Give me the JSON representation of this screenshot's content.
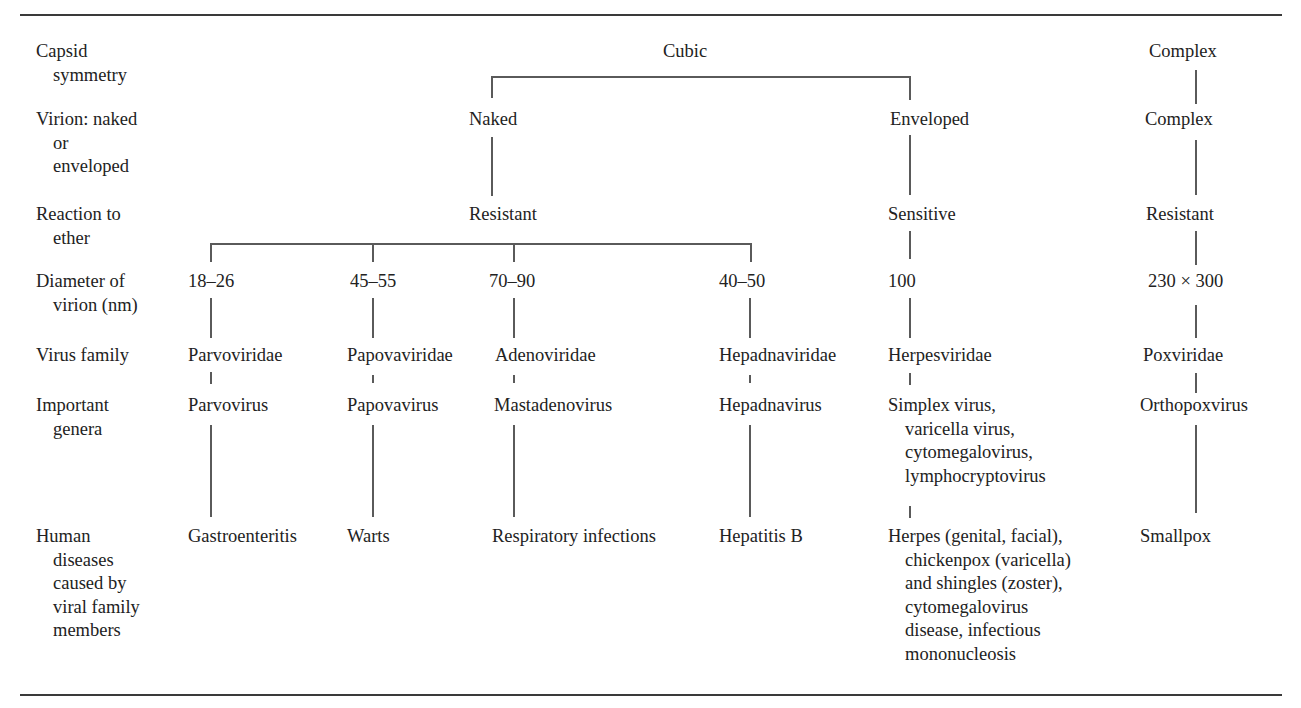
{
  "row_labels": [
    {
      "id": "capsid",
      "lines": [
        "Capsid",
        "symmetry"
      ]
    },
    {
      "id": "virion",
      "lines": [
        "Virion: naked",
        "or",
        "enveloped"
      ]
    },
    {
      "id": "ether",
      "lines": [
        "Reaction to",
        "ether"
      ]
    },
    {
      "id": "diameter",
      "lines": [
        "Diameter of",
        "virion (nm)"
      ]
    },
    {
      "id": "family",
      "lines": [
        "Virus family"
      ]
    },
    {
      "id": "genera",
      "lines": [
        "Important",
        "genera"
      ]
    },
    {
      "id": "diseases",
      "lines": [
        "Human",
        "diseases",
        "caused by",
        "viral family",
        "members"
      ]
    }
  ],
  "capsid_symmetry": {
    "cubic": "Cubic",
    "complex": "Complex"
  },
  "virion": {
    "naked": "Naked",
    "enveloped": "Enveloped",
    "complex": "Complex"
  },
  "ether_reaction": {
    "naked": "Resistant",
    "enveloped": "Sensitive",
    "complex": "Resistant"
  },
  "families": [
    {
      "diameter": "18–26",
      "family": "Parvoviridae",
      "genera": [
        "Parvovirus"
      ],
      "diseases": [
        "Gastroenteritis"
      ]
    },
    {
      "diameter": "45–55",
      "family": "Papovaviridae",
      "genera": [
        "Papovavirus"
      ],
      "diseases": [
        "Warts"
      ]
    },
    {
      "diameter": "70–90",
      "family": "Adenoviridae",
      "genera": [
        "Mastadenovirus"
      ],
      "diseases": [
        "Respiratory infections"
      ]
    },
    {
      "diameter": "40–50",
      "family": "Hepadnaviridae",
      "genera": [
        "Hepadnavirus"
      ],
      "diseases": [
        "Hepatitis B"
      ]
    },
    {
      "diameter": "100",
      "family": "Herpesviridae",
      "genera": [
        "Simplex virus,",
        "varicella virus,",
        "cytomegalovirus,",
        "lymphocryptovirus"
      ],
      "diseases": [
        "Herpes (genital, facial),",
        "chickenpox (varicella)",
        "and shingles (zoster),",
        "cytomegalovirus",
        "disease, infectious",
        "mononucleosis"
      ]
    },
    {
      "diameter": "230 × 300",
      "family": "Poxviridae",
      "genera": [
        "Orthopoxvirus"
      ],
      "diseases": [
        "Smallpox"
      ]
    }
  ]
}
